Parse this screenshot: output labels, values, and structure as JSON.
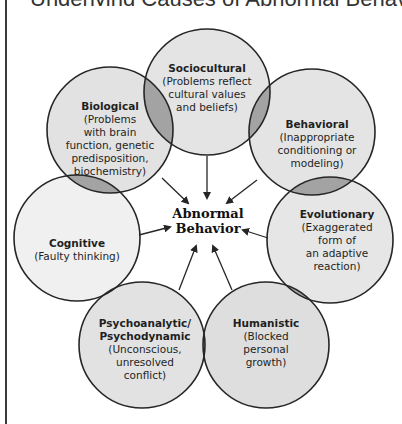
{
  "title": {
    "text": "Underlying Causes of Abnormal Behavior"
  },
  "colors": {
    "circle_fill": "#e4e4e4",
    "circle_fill_light": "#f0f0f0",
    "overlap_fill": "#9e9e9e",
    "stroke": "#262626",
    "background": "#ffffff"
  },
  "center": {
    "line1": "Abnormal",
    "line2": "Behavior"
  },
  "perspectives": [
    {
      "id": "sociocultural",
      "heading": "Sociocultural",
      "description": "(Problems reflect\ncultural values\nand beliefs)"
    },
    {
      "id": "behavioral",
      "heading": "Behavioral",
      "description": "(Inappropriate\nconditioning or\nmodeling)"
    },
    {
      "id": "evolutionary",
      "heading": "Evolutionary",
      "description": "(Exaggerated\nform of\nan adaptive\nreaction)"
    },
    {
      "id": "humanistic",
      "heading": "Humanistic",
      "description": "(Blocked\npersonal\ngrowth)"
    },
    {
      "id": "psychoanalytic",
      "heading": "Psychoanalytic/\nPsychodynamic",
      "description": "(Unconscious,\nunresolved\nconflict)"
    },
    {
      "id": "cognitive",
      "heading": "Cognitive",
      "description": "(Faulty thinking)"
    },
    {
      "id": "biological",
      "heading": "Biological",
      "description": "(Problems\nwith brain\nfunction, genetic\npredisposition,\nbiochemistry)"
    }
  ]
}
